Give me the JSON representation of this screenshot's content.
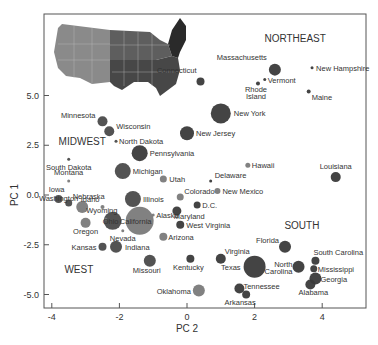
{
  "chart_data": {
    "type": "scatter",
    "title": "",
    "xlabel": "PC 2",
    "ylabel": "PC 1",
    "xlim": [
      -4.2,
      5.3
    ],
    "ylim": [
      -5.7,
      8.9
    ],
    "xticks": [
      "-4",
      "-2",
      "0",
      "2",
      "4"
    ],
    "yticks": [
      "5.0",
      "2.5",
      "0.0",
      "-2.5",
      "-5.0"
    ],
    "grid": false,
    "legend": "none (region labels placed in plot; inset US map colored by region)",
    "region_labels": [
      {
        "text": "NORTHEAST",
        "x": 3.2,
        "y": 7.7
      },
      {
        "text": "MIDWEST",
        "x": -3.1,
        "y": 2.5
      },
      {
        "text": "SOUTH",
        "x": 3.4,
        "y": -1.7
      },
      {
        "text": "WEST",
        "x": -3.2,
        "y": -3.9
      }
    ],
    "points": [
      {
        "name": "Massachusetts",
        "x": 2.6,
        "y": 6.3,
        "size": 6,
        "shade": "#3a3a3a"
      },
      {
        "name": "Connecticut",
        "x": 0.4,
        "y": 5.7,
        "size": 4,
        "shade": "#3a3a3a"
      },
      {
        "name": "New Hampshire",
        "x": 3.7,
        "y": 6.4,
        "size": 1.5,
        "shade": "#3a3a3a"
      },
      {
        "name": "Vermont",
        "x": 2.3,
        "y": 5.8,
        "size": 1.5,
        "shade": "#3a3a3a"
      },
      {
        "name": "Rhode Island",
        "x": 2.1,
        "y": 5.6,
        "size": 2,
        "shade": "#3a3a3a"
      },
      {
        "name": "Maine",
        "x": 3.6,
        "y": 5.2,
        "size": 2,
        "shade": "#3a3a3a"
      },
      {
        "name": "New York",
        "x": 1.0,
        "y": 4.1,
        "size": 10,
        "shade": "#3a3a3a"
      },
      {
        "name": "New Jersey",
        "x": 0.0,
        "y": 3.1,
        "size": 7,
        "shade": "#3a3a3a"
      },
      {
        "name": "Pennsylvania",
        "x": -1.4,
        "y": 2.1,
        "size": 8,
        "shade": "#3a3a3a"
      },
      {
        "name": "Minnesota",
        "x": -2.5,
        "y": 3.7,
        "size": 5,
        "shade": "#4a4a4a"
      },
      {
        "name": "Wisconsin",
        "x": -2.3,
        "y": 3.2,
        "size": 5,
        "shade": "#4a4a4a"
      },
      {
        "name": "North Dakota",
        "x": -2.1,
        "y": 2.7,
        "size": 1.5,
        "shade": "#4a4a4a"
      },
      {
        "name": "South Dakota",
        "x": -3.5,
        "y": 1.8,
        "size": 1.5,
        "shade": "#4a4a4a"
      },
      {
        "name": "Michigan",
        "x": -1.9,
        "y": 1.2,
        "size": 8,
        "shade": "#4a4a4a"
      },
      {
        "name": "Montana",
        "x": -3.5,
        "y": 0.7,
        "size": 1.5,
        "shade": "#7a7a7a"
      },
      {
        "name": "Iowa",
        "x": -3.8,
        "y": -0.2,
        "size": 4,
        "shade": "#4a4a4a"
      },
      {
        "name": "Nebraska",
        "x": -3.5,
        "y": -0.4,
        "size": 3.5,
        "shade": "#4a4a4a"
      },
      {
        "name": "Illinois",
        "x": -1.6,
        "y": -0.2,
        "size": 8,
        "shade": "#4a4a4a"
      },
      {
        "name": "Utah",
        "x": -0.7,
        "y": 0.8,
        "size": 3.5,
        "shade": "#7a7a7a"
      },
      {
        "name": "Colorado",
        "x": -0.2,
        "y": -0.1,
        "size": 3.5,
        "shade": "#7a7a7a"
      },
      {
        "name": "Delaware",
        "x": 0.7,
        "y": 0.7,
        "size": 1.5,
        "shade": "#3a3a3a"
      },
      {
        "name": "New Mexico",
        "x": 0.9,
        "y": 0.2,
        "size": 3,
        "shade": "#7a7a7a"
      },
      {
        "name": "Hawaii",
        "x": 1.8,
        "y": 1.5,
        "size": 2.5,
        "shade": "#7a7a7a"
      },
      {
        "name": "Louisiana",
        "x": 4.4,
        "y": 0.9,
        "size": 5,
        "shade": "#3a3a3a"
      },
      {
        "name": "D.C.",
        "x": 0.3,
        "y": -0.5,
        "size": 3.5,
        "shade": "#3a3a3a"
      },
      {
        "name": "Maryland",
        "x": -0.3,
        "y": -0.8,
        "size": 4.5,
        "shade": "#3a3a3a"
      },
      {
        "name": "Idaho",
        "x": -2.5,
        "y": -0.6,
        "size": 2,
        "shade": "#7a7a7a"
      },
      {
        "name": "Washington",
        "x": -3.1,
        "y": -0.6,
        "size": 6,
        "shade": "#7a7a7a"
      },
      {
        "name": "Wyoming",
        "x": -2.4,
        "y": -1.2,
        "size": 1.5,
        "shade": "#7a7a7a"
      },
      {
        "name": "Ohio",
        "x": -2.2,
        "y": -1.3,
        "size": 9,
        "shade": "#4a4a4a"
      },
      {
        "name": "Oregon",
        "x": -3.0,
        "y": -1.4,
        "size": 5,
        "shade": "#7a7a7a"
      },
      {
        "name": "California",
        "x": -1.4,
        "y": -1.3,
        "size": 14,
        "shade": "#7a7a7a"
      },
      {
        "name": "Alaska",
        "x": -1.0,
        "y": -1.0,
        "size": 1.5,
        "shade": "#7a7a7a"
      },
      {
        "name": "Nevada",
        "x": -1.9,
        "y": -1.8,
        "size": 1.5,
        "shade": "#7a7a7a"
      },
      {
        "name": "West Virginia",
        "x": -0.2,
        "y": -1.5,
        "size": 4,
        "shade": "#3a3a3a"
      },
      {
        "name": "Arizona",
        "x": -0.7,
        "y": -2.1,
        "size": 4,
        "shade": "#7a7a7a"
      },
      {
        "name": "Kansas",
        "x": -2.5,
        "y": -2.6,
        "size": 4,
        "shade": "#4a4a4a"
      },
      {
        "name": "Indiana",
        "x": -2.1,
        "y": -2.6,
        "size": 6,
        "shade": "#4a4a4a"
      },
      {
        "name": "Missouri",
        "x": -1.1,
        "y": -3.3,
        "size": 6,
        "shade": "#4a4a4a"
      },
      {
        "name": "Kentucky",
        "x": 0.1,
        "y": -3.2,
        "size": 4,
        "shade": "#3a3a3a"
      },
      {
        "name": "Virginia",
        "x": 1.0,
        "y": -3.2,
        "size": 5,
        "shade": "#3a3a3a"
      },
      {
        "name": "Florida",
        "x": 2.9,
        "y": -2.6,
        "size": 6,
        "shade": "#3a3a3a"
      },
      {
        "name": "Texas",
        "x": 2.0,
        "y": -3.6,
        "size": 11,
        "shade": "#3a3a3a"
      },
      {
        "name": "North Carolina",
        "x": 3.3,
        "y": -3.6,
        "size": 6,
        "shade": "#3a3a3a"
      },
      {
        "name": "South Carolina",
        "x": 3.8,
        "y": -3.3,
        "size": 4,
        "shade": "#3a3a3a"
      },
      {
        "name": "Mississippi",
        "x": 3.75,
        "y": -3.7,
        "size": 3.5,
        "shade": "#3a3a3a"
      },
      {
        "name": "Georgia",
        "x": 3.8,
        "y": -4.2,
        "size": 6,
        "shade": "#3a3a3a"
      },
      {
        "name": "Alabama",
        "x": 3.65,
        "y": -4.5,
        "size": 5,
        "shade": "#3a3a3a"
      },
      {
        "name": "Oklahoma",
        "x": 0.35,
        "y": -4.8,
        "size": 6,
        "shade": "#7a7a7a"
      },
      {
        "name": "Tennessee",
        "x": 1.55,
        "y": -4.7,
        "size": 5,
        "shade": "#3a3a3a"
      },
      {
        "name": "Arkansas",
        "x": 1.75,
        "y": -5.0,
        "size": 4,
        "shade": "#3a3a3a"
      }
    ]
  },
  "inset_map": {
    "description": "US map colored by region",
    "colors": {
      "west": "#8a8a8a",
      "midwest": "#5e5e5e",
      "south": "#4a4a4a",
      "northeast": "#2a2a2a"
    }
  }
}
